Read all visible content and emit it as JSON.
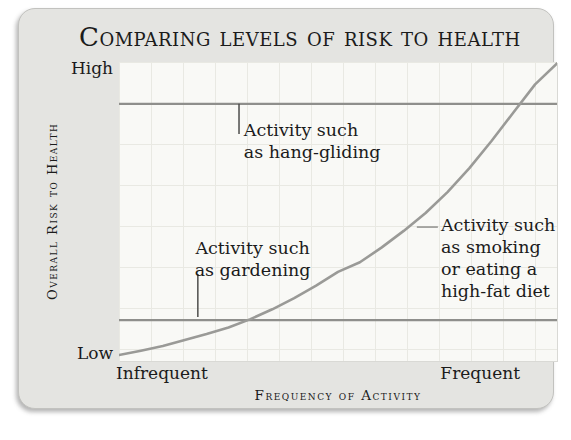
{
  "colors": {
    "page_bg": "#ffffff",
    "card_bg": "#e4e4e1",
    "card_border": "#c2c2bf",
    "plot_bg": "#f9f9f6",
    "grid_line": "#e9e9e3",
    "curve": "#9a9a97",
    "reference_line": "#8f8f8c",
    "tick_dark": "#4d4d4b",
    "tick_light": "#8f8f8c",
    "text": "#1b1b1b"
  },
  "chart_data": {
    "type": "line",
    "title": "Comparing levels of risk to health",
    "xlabel": "Frequency of Activity",
    "ylabel": "Overall Risk to Health",
    "x_axis": {
      "min_label": "Infrequent",
      "max_label": "Frequent",
      "numeric_ticks": false
    },
    "y_axis": {
      "min_label": "Low",
      "max_label": "High",
      "numeric_ticks": false
    },
    "grid": true,
    "legend": false,
    "series": [
      {
        "name": "overall-risk-vs-frequency",
        "shape": "accelerating-exponential",
        "points_pct": [
          [
            0,
            2
          ],
          [
            5,
            3.4
          ],
          [
            10,
            5
          ],
          [
            15,
            7
          ],
          [
            20,
            9
          ],
          [
            25,
            11.2
          ],
          [
            30,
            14
          ],
          [
            35,
            17.3
          ],
          [
            40,
            21
          ],
          [
            45,
            25.2
          ],
          [
            50,
            29.8
          ],
          [
            55,
            33
          ],
          [
            60,
            38
          ],
          [
            65,
            43.5
          ],
          [
            70,
            49.5
          ],
          [
            75,
            56.5
          ],
          [
            80,
            64.5
          ],
          [
            85,
            73.5
          ],
          [
            90,
            83
          ],
          [
            95,
            92.5
          ],
          [
            100,
            99.5
          ]
        ]
      }
    ],
    "reference_lines": [
      {
        "id": "hang-gliding-risk-level",
        "v_pct": 86
      },
      {
        "id": "gardening-risk-level",
        "v_pct": 13.7
      }
    ],
    "annotations": [
      {
        "id": "hang-gliding",
        "lines": [
          "Activity such",
          "as hang-gliding"
        ],
        "x_pct": 28.5,
        "v_pct": 81,
        "align": "left",
        "tick": {
          "orient": "v",
          "x_pct": 27.4,
          "v1_pct": 86,
          "v2_pct": 75.9,
          "shade": "dark"
        }
      },
      {
        "id": "gardening",
        "lines": [
          "Activity such",
          "as gardening"
        ],
        "x_pct": 30.5,
        "v_pct": 41.5,
        "align": "center",
        "tick": {
          "orient": "v",
          "x_pct": 18,
          "v1_pct": 29.1,
          "v2_pct": 14.7,
          "shade": "dark"
        }
      },
      {
        "id": "smoking-high-fat-diet",
        "lines": [
          "Activity such",
          "as smoking",
          "or eating a",
          "high-fat diet"
        ],
        "x_pct": 73.5,
        "v_pct": 49.2,
        "align": "left",
        "tick": {
          "orient": "h",
          "v_pct": 44.8,
          "x1_pct": 68,
          "x2_pct": 72.8,
          "shade": "light"
        }
      }
    ]
  }
}
